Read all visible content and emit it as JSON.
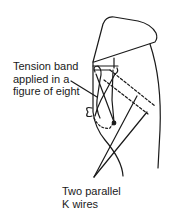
{
  "diagram": {
    "type": "medical-illustration",
    "labels": {
      "tension_band": {
        "lines": [
          "Tension band",
          "applied in a",
          "figure of eight"
        ]
      },
      "k_wires": {
        "lines": [
          "Two parallel",
          "K wires"
        ]
      }
    },
    "colors": {
      "stroke": "#1a1a1a",
      "background": "#ffffff"
    }
  }
}
